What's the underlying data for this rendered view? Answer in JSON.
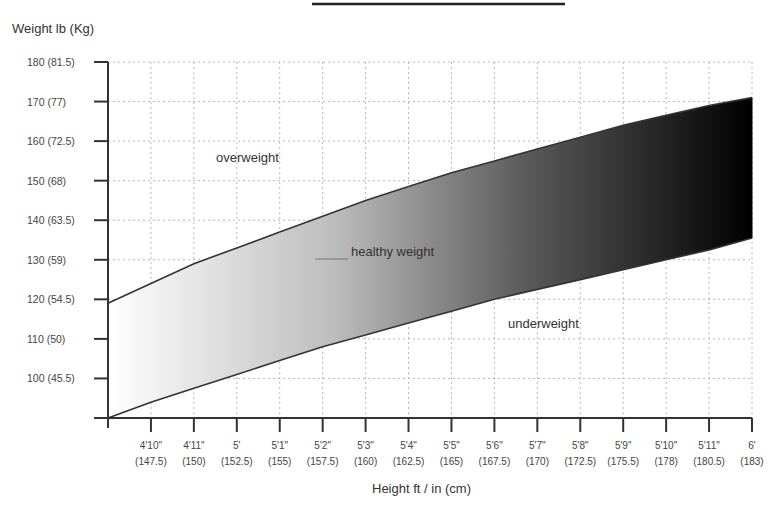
{
  "chart_data": {
    "type": "area",
    "title": "",
    "ylabel": "Weight lb (Kg)",
    "xlabel": "Height ft / in (cm)",
    "y_ticks": [
      {
        "value": 180,
        "label": "180 (81.5)"
      },
      {
        "value": 170,
        "label": "170 (77)"
      },
      {
        "value": 160,
        "label": "160 (72.5)"
      },
      {
        "value": 150,
        "label": "150 (68)"
      },
      {
        "value": 140,
        "label": "140 (63.5)"
      },
      {
        "value": 130,
        "label": "130 (59)"
      },
      {
        "value": 120,
        "label": "120 (54.5)"
      },
      {
        "value": 110,
        "label": "110 (50)"
      },
      {
        "value": 100,
        "label": "100 (45.5)"
      }
    ],
    "x_ticks": [
      {
        "ft": "4'10\"",
        "cm": "(147.5)"
      },
      {
        "ft": "4'11\"",
        "cm": "(150)"
      },
      {
        "ft": "5'",
        "cm": "(152.5)"
      },
      {
        "ft": "5'1\"",
        "cm": "(155)"
      },
      {
        "ft": "5'2\"",
        "cm": "(157.5)"
      },
      {
        "ft": "5'3\"",
        "cm": "(160)"
      },
      {
        "ft": "5'4\"",
        "cm": "(162.5)"
      },
      {
        "ft": "5'5\"",
        "cm": "(165)"
      },
      {
        "ft": "5'6\"",
        "cm": "(167.5)"
      },
      {
        "ft": "5'7\"",
        "cm": "(170)"
      },
      {
        "ft": "5'8\"",
        "cm": "(172.5)"
      },
      {
        "ft": "5'9\"",
        "cm": "(175.5)"
      },
      {
        "ft": "5'10\"",
        "cm": "(178)"
      },
      {
        "ft": "5'11\"",
        "cm": "(180.5)"
      },
      {
        "ft": "6'",
        "cm": "(183)"
      }
    ],
    "x_inches": [
      57,
      58,
      59,
      60,
      61,
      62,
      63,
      64,
      65,
      66,
      67,
      68,
      69,
      70,
      71,
      72
    ],
    "series": [
      {
        "name": "healthy weight upper bound",
        "values": [
          119,
          124,
          129,
          133,
          137,
          141,
          145,
          148.5,
          152,
          155,
          158,
          161,
          164,
          166.5,
          169,
          171
        ]
      },
      {
        "name": "healthy weight lower bound",
        "values": [
          90,
          94,
          97.5,
          101,
          104.5,
          108,
          111,
          114,
          117,
          120,
          122.5,
          125,
          127.5,
          130,
          132.5,
          135.5
        ]
      }
    ],
    "regions": [
      {
        "label": "overweight",
        "position": "above band"
      },
      {
        "label": "healthy weight",
        "position": "band, gradient white to black"
      },
      {
        "label": "underweight",
        "position": "below band"
      }
    ],
    "ylim": [
      90,
      180
    ],
    "grid": true,
    "legend": "none (inline region labels)",
    "colors": {
      "band_start": "#ffffff",
      "band_end": "#000000",
      "curve": "#333333",
      "grid": "#b8b8b8"
    }
  },
  "labels": {
    "y_axis_title": "Weight lb (Kg)",
    "x_axis_title": "Height ft / in (cm)",
    "overweight": "overweight",
    "healthy": "healthy weight",
    "underweight": "underweight"
  }
}
